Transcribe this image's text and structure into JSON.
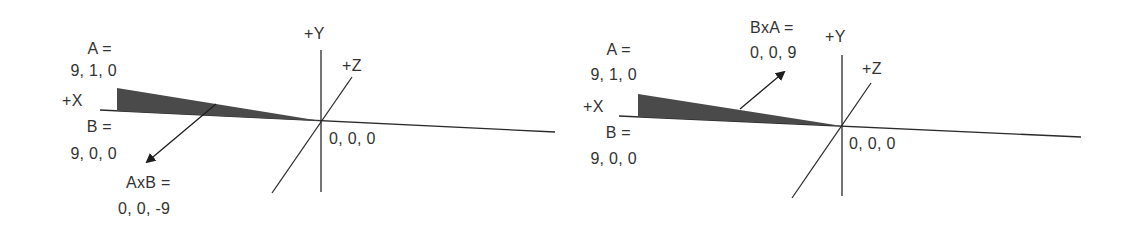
{
  "colors": {
    "line": "#2a2a2a",
    "fill": "#4a4a4a",
    "text": "#333333",
    "background": "#ffffff"
  },
  "panels": [
    {
      "id": "left",
      "axes": {
        "y_label": "+Y",
        "z_label": "+Z",
        "x_label": "+X",
        "origin_label": "0, 0, 0"
      },
      "vector_a": {
        "label": "A =",
        "value": "9, 1, 0"
      },
      "vector_b": {
        "label": "B =",
        "value": "9, 0, 0"
      },
      "cross": {
        "label": "AxB =",
        "value": "0, 0, -9",
        "direction": "down-left (-Z)"
      }
    },
    {
      "id": "right",
      "axes": {
        "y_label": "+Y",
        "z_label": "+Z",
        "x_label": "+X",
        "origin_label": "0, 0, 0"
      },
      "vector_a": {
        "label": "A =",
        "value": "9, 1, 0"
      },
      "vector_b": {
        "label": "B =",
        "value": "9, 0, 0"
      },
      "cross": {
        "label": "BxA =",
        "value": "0, 0, 9",
        "direction": "up-right (+Z)"
      }
    }
  ]
}
